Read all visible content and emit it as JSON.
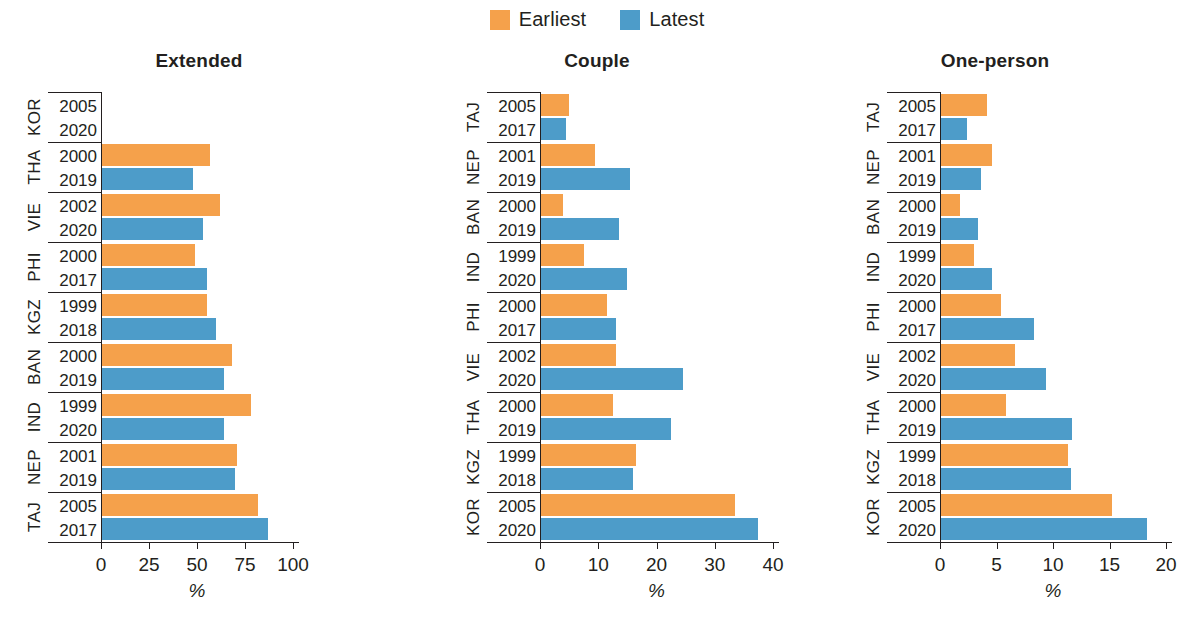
{
  "legend": {
    "items": [
      {
        "label": "Earliest",
        "color": "#f5a14b",
        "key": "earliest"
      },
      {
        "label": "Latest",
        "color": "#4d9cc9",
        "key": "latest"
      }
    ]
  },
  "axis_unit_label": "%",
  "colors": {
    "earliest": "#f5a14b",
    "latest": "#4d9cc9",
    "ink": "#231f20"
  },
  "chart_data": [
    {
      "type": "bar",
      "title": "Extended",
      "orientation": "horizontal",
      "xlabel": "%",
      "ylabel": "",
      "xlim": [
        0,
        100
      ],
      "xticks": [
        0,
        25,
        50,
        75,
        100
      ],
      "xtick_labels": [
        "0",
        "25",
        "50",
        "75",
        "100"
      ],
      "grid": false,
      "legend_position": "top-center",
      "categories": [
        "KOR",
        "THA",
        "VIE",
        "PHI",
        "KGZ",
        "BAN",
        "IND",
        "NEP",
        "TAJ"
      ],
      "earliest_years": [
        "2005",
        "2000",
        "2002",
        "2000",
        "1999",
        "2000",
        "1999",
        "2001",
        "2005"
      ],
      "latest_years": [
        "2020",
        "2019",
        "2020",
        "2017",
        "2018",
        "2019",
        "2020",
        "2019",
        "2017"
      ],
      "series": [
        {
          "name": "Earliest",
          "values": [
            null,
            57,
            62,
            49,
            55,
            68,
            78,
            71,
            82
          ]
        },
        {
          "name": "Latest",
          "values": [
            null,
            48,
            53,
            55,
            60,
            64,
            64,
            70,
            87
          ]
        }
      ]
    },
    {
      "type": "bar",
      "title": "Couple",
      "orientation": "horizontal",
      "xlabel": "%",
      "ylabel": "",
      "xlim": [
        0,
        40
      ],
      "xticks": [
        0,
        10,
        20,
        30,
        40
      ],
      "xtick_labels": [
        "0",
        "10",
        "20",
        "30",
        "40"
      ],
      "grid": false,
      "legend_position": "top-center",
      "categories": [
        "TAJ",
        "NEP",
        "BAN",
        "IND",
        "PHI",
        "VIE",
        "THA",
        "KGZ",
        "KOR"
      ],
      "earliest_years": [
        "2005",
        "2001",
        "2000",
        "1999",
        "2000",
        "2002",
        "2000",
        "1999",
        "2005"
      ],
      "latest_years": [
        "2017",
        "2019",
        "2019",
        "2020",
        "2017",
        "2020",
        "2019",
        "2018",
        "2020"
      ],
      "series": [
        {
          "name": "Earliest",
          "values": [
            5.0,
            9.5,
            4.0,
            7.5,
            11.5,
            13.0,
            12.5,
            16.5,
            33.5
          ]
        },
        {
          "name": "Latest",
          "values": [
            4.5,
            15.5,
            13.5,
            15.0,
            13.0,
            24.5,
            22.5,
            16.0,
            37.5
          ]
        }
      ]
    },
    {
      "type": "bar",
      "title": "One-person",
      "orientation": "horizontal",
      "xlabel": "%",
      "ylabel": "",
      "xlim": [
        0,
        20
      ],
      "xticks": [
        0,
        5,
        10,
        15,
        20
      ],
      "xtick_labels": [
        "0",
        "5",
        "10",
        "15",
        "20"
      ],
      "grid": false,
      "legend_position": "top-center",
      "categories": [
        "TAJ",
        "NEP",
        "BAN",
        "IND",
        "PHI",
        "VIE",
        "THA",
        "KGZ",
        "KOR"
      ],
      "earliest_years": [
        "2005",
        "2001",
        "2000",
        "1999",
        "2000",
        "2002",
        "2000",
        "1999",
        "2005"
      ],
      "latest_years": [
        "2017",
        "2019",
        "2019",
        "2020",
        "2017",
        "2020",
        "2019",
        "2018",
        "2020"
      ],
      "series": [
        {
          "name": "Earliest",
          "values": [
            4.2,
            4.6,
            1.8,
            3.0,
            5.4,
            6.6,
            5.8,
            11.3,
            15.2
          ]
        },
        {
          "name": "Latest",
          "values": [
            2.4,
            3.6,
            3.4,
            4.6,
            8.3,
            9.4,
            11.7,
            11.6,
            18.3
          ]
        }
      ]
    }
  ]
}
